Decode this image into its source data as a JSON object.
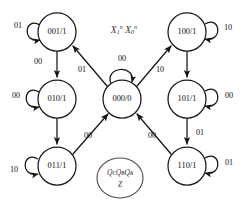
{
  "diagram": {
    "title_symbol": "X₁ⁿ X₀ⁿ",
    "input_caption_parts": {
      "x1_base": "X",
      "x1_sub": "1",
      "x1_sup": "n",
      "x0_base": "X",
      "x0_sub": "0",
      "x0_sup": "n"
    },
    "legend": {
      "line1": "QᴄQʙQᴀ",
      "line2": "Z",
      "line1_plain": "QCQBQA",
      "line2_plain": "Z"
    },
    "bottom_caption": ""
  },
  "states": [
    {
      "id": "s001",
      "label": "001/1",
      "cx": 57,
      "cy": 32,
      "r": 19
    },
    {
      "id": "s010",
      "label": "010/1",
      "cx": 57,
      "cy": 99,
      "r": 19
    },
    {
      "id": "s011",
      "label": "011/1",
      "cx": 57,
      "cy": 166,
      "r": 19
    },
    {
      "id": "s000",
      "label": "000/0",
      "cx": 122,
      "cy": 99,
      "r": 19
    },
    {
      "id": "s100",
      "label": "100/1",
      "cx": 187,
      "cy": 32,
      "r": 19
    },
    {
      "id": "s101",
      "label": "101/1",
      "cx": 187,
      "cy": 99,
      "r": 19
    },
    {
      "id": "s110",
      "label": "110/1",
      "cx": 187,
      "cy": 166,
      "r": 19
    }
  ],
  "self_loops": [
    {
      "id": "loop001",
      "state": "001/1",
      "input": "01",
      "label_x": 18,
      "label_y": 26
    },
    {
      "id": "loop010",
      "state": "010/1",
      "input": "00",
      "label_x": 16,
      "label_y": 96
    },
    {
      "id": "loop011",
      "state": "011/1",
      "input": "10",
      "label_x": 14,
      "label_y": 170
    },
    {
      "id": "loop000",
      "state": "000/0",
      "input": "00",
      "label_x": 122,
      "label_y": 59
    },
    {
      "id": "loop100",
      "state": "100/1",
      "input": "10",
      "label_x": 228,
      "label_y": 28
    },
    {
      "id": "loop101",
      "state": "101/1",
      "input": "00",
      "label_x": 229,
      "label_y": 96
    },
    {
      "id": "loop110",
      "state": "110/1",
      "input": "01",
      "label_x": 229,
      "label_y": 163
    }
  ],
  "transitions": [
    {
      "id": "t001_010",
      "from": "001/1",
      "to": "010/1",
      "input": "00",
      "label_x": 38,
      "label_y": 62
    },
    {
      "id": "t010_011",
      "from": "010/1",
      "to": "011/1",
      "input": "",
      "label_x": 38,
      "label_y": 133
    },
    {
      "id": "t000_001",
      "from": "000/0",
      "to": "001/1",
      "input": "01",
      "label_x": 82,
      "label_y": 70
    },
    {
      "id": "t011_000",
      "from": "011/1",
      "to": "000/0",
      "input": "00",
      "label_x": 88,
      "label_y": 136
    },
    {
      "id": "t000_100",
      "from": "000/0",
      "to": "100/1",
      "input": "10",
      "label_x": 160,
      "label_y": 70
    },
    {
      "id": "t100_101",
      "from": "100/1",
      "to": "101/1",
      "input": "",
      "label_x": 200,
      "label_y": 62
    },
    {
      "id": "t101_110",
      "from": "101/1",
      "to": "110/1",
      "input": "01",
      "label_x": 200,
      "label_y": 133
    },
    {
      "id": "t110_000",
      "from": "110/1",
      "to": "000/0",
      "input": "00",
      "label_x": 152,
      "label_y": 136
    }
  ]
}
